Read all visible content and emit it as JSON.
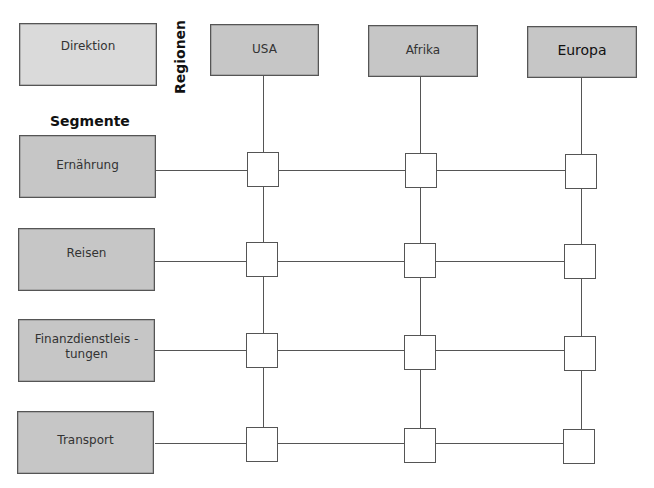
{
  "diagram": {
    "type": "matrix-organization",
    "top_left_box": {
      "label": "Direktion"
    },
    "axis_labels": {
      "columns": "Regionen",
      "rows": "Segmente"
    },
    "regions": [
      {
        "label": "USA"
      },
      {
        "label": "Afrika"
      },
      {
        "label": "Europa"
      }
    ],
    "segments": [
      {
        "label": "Ernährung"
      },
      {
        "label": "Reisen"
      },
      {
        "label": "Finanzdienstleis-\ntungen",
        "line1": "Finanzdienstleis -",
        "line2": "tungen"
      },
      {
        "label": "Transport"
      }
    ],
    "nodes": "4 x 3 grid of intersection squares",
    "colors": {
      "direktion_fill": "#dadada",
      "box_fill": "#c6c6c6",
      "line": "#555555",
      "node_fill": "#ffffff"
    }
  }
}
